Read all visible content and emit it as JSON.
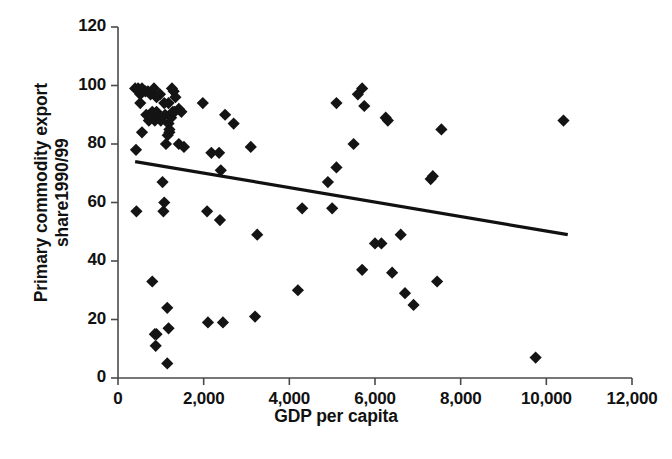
{
  "chart_data": {
    "type": "scatter",
    "title": "",
    "xlabel": "GDP per capita",
    "ylabel": "Primary commodity export\nshare1990/99",
    "ylabel_lines": [
      "Primary commodity export",
      "share1990/99"
    ],
    "xlim": [
      0,
      12000
    ],
    "ylim": [
      0,
      120
    ],
    "xticks": [
      0,
      2000,
      4000,
      6000,
      8000,
      10000,
      12000
    ],
    "xticklabels": [
      "0",
      "2,000",
      "4,000",
      "6,000",
      "8,000",
      "10,000",
      "12,000"
    ],
    "yticks": [
      0,
      20,
      40,
      60,
      80,
      100,
      120
    ],
    "yticklabels": [
      "0",
      "20",
      "40",
      "60",
      "80",
      "100",
      "120"
    ],
    "grid": false,
    "legend": null,
    "marker": "diamond",
    "marker_color": "#141414",
    "marker_size": 9,
    "series": [
      {
        "name": "Countries",
        "points": [
          [
            400,
            99
          ],
          [
            470,
            99
          ],
          [
            520,
            97
          ],
          [
            560,
            99
          ],
          [
            640,
            98
          ],
          [
            700,
            98
          ],
          [
            760,
            97
          ],
          [
            840,
            99
          ],
          [
            900,
            96
          ],
          [
            980,
            97
          ],
          [
            1080,
            94
          ],
          [
            1180,
            94
          ],
          [
            1260,
            99
          ],
          [
            1300,
            98
          ],
          [
            1340,
            96
          ],
          [
            520,
            94
          ],
          [
            660,
            90
          ],
          [
            720,
            88
          ],
          [
            760,
            90
          ],
          [
            800,
            91
          ],
          [
            860,
            88
          ],
          [
            900,
            91
          ],
          [
            960,
            89
          ],
          [
            1000,
            88
          ],
          [
            1100,
            90
          ],
          [
            1180,
            87
          ],
          [
            1200,
            84
          ],
          [
            1240,
            89
          ],
          [
            1280,
            91
          ],
          [
            1320,
            91
          ],
          [
            1420,
            92
          ],
          [
            1480,
            91
          ],
          [
            560,
            84
          ],
          [
            1160,
            83
          ],
          [
            1200,
            85
          ],
          [
            1980,
            94
          ],
          [
            2500,
            90
          ],
          [
            2700,
            87
          ],
          [
            5100,
            94
          ],
          [
            420,
            78
          ],
          [
            1120,
            80
          ],
          [
            1420,
            80
          ],
          [
            1540,
            79
          ],
          [
            2180,
            77
          ],
          [
            2360,
            77
          ],
          [
            3100,
            79
          ],
          [
            5700,
            99
          ],
          [
            5600,
            97
          ],
          [
            5750,
            93
          ],
          [
            6300,
            88
          ],
          [
            7550,
            85
          ],
          [
            10400,
            88
          ],
          [
            5500,
            80
          ],
          [
            6250,
            89
          ],
          [
            4900,
            67
          ],
          [
            5100,
            72
          ],
          [
            1040,
            67
          ],
          [
            2400,
            71
          ],
          [
            7300,
            68
          ],
          [
            430,
            57
          ],
          [
            1060,
            57
          ],
          [
            1080,
            60
          ],
          [
            2080,
            57
          ],
          [
            2380,
            54
          ],
          [
            5000,
            58
          ],
          [
            7350,
            69
          ],
          [
            3250,
            49
          ],
          [
            6000,
            46
          ],
          [
            6150,
            46
          ],
          [
            6600,
            49
          ],
          [
            4300,
            58
          ],
          [
            800,
            33
          ],
          [
            4200,
            30
          ],
          [
            6700,
            29
          ],
          [
            6900,
            25
          ],
          [
            5700,
            37
          ],
          [
            7450,
            33
          ],
          [
            6400,
            36
          ],
          [
            1150,
            24
          ],
          [
            1180,
            17
          ],
          [
            900,
            15
          ],
          [
            860,
            15
          ],
          [
            880,
            11
          ],
          [
            2100,
            19
          ],
          [
            2450,
            19
          ],
          [
            3200,
            21
          ],
          [
            1150,
            5
          ],
          [
            9750,
            7
          ]
        ]
      }
    ],
    "trendline": {
      "x_start": 400,
      "y_start": 74,
      "x_end": 10500,
      "y_end": 49,
      "color": "#111111",
      "width": 3.2
    }
  }
}
